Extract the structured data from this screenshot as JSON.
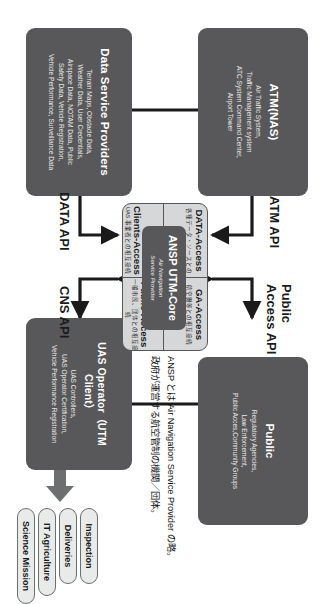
{
  "diagram": {
    "boxes": {
      "atm": {
        "title": "ATM(NAS)",
        "subtitle": "Air Traffic System,\nTraffic Management system\nATC System Command Center,\nAirport Tower"
      },
      "public": {
        "title": "Public",
        "subtitle": "Regulatory Agencies,\nLaw Enforcement,\nPublic Acces,Community Groups"
      },
      "data_service_providers": {
        "title": "Data Service Providers",
        "subtitle": "Terrain Maps, Obstacle Data,\nWeather Data, User Credentials,\nAirspace Data, NOTAM Data, Public\nSafety Data, Vehicle Registration,\nVehicle Performance, Surveillance Data"
      },
      "uas_operator": {
        "title": "UAS Operator（UTM Client）",
        "subtitle": "UAS Controllers,\nUAS Operator Certification,\nVehicle Performance Registration"
      }
    },
    "core": {
      "title": "ANSP UTM-Core",
      "subtitle": "Air Navigation\nService Provider",
      "quadrants": [
        {
          "name": "data-access",
          "title": "DATA-Access",
          "subtitle": "各種データ・ソースとの\n相互接続"
        },
        {
          "name": "ga-access",
          "title": "GA-Access",
          "subtitle": "航空機等との相互接続"
        },
        {
          "name": "utm-clients-access",
          "title": "UTM\nClients-Access",
          "subtitle": "UAS 事業者との相互接続"
        },
        {
          "name": "public-access",
          "title": "Public-Access",
          "subtitle": "一般市民、団体との相互接続"
        }
      ]
    },
    "api_labels": [
      {
        "name": "atm-api",
        "text": "ATM API"
      },
      {
        "name": "public-access-api",
        "text": "Public\nAccess API"
      },
      {
        "name": "data-api",
        "text": "DATA API"
      },
      {
        "name": "cns-api",
        "text": "CNS API"
      }
    ],
    "pills": [
      {
        "name": "inspection",
        "text": "Inspection"
      },
      {
        "name": "deliveries",
        "text": "Deliveries"
      },
      {
        "name": "it-agriculture",
        "text": "IT Agriculture"
      },
      {
        "name": "science-mission",
        "text": "Science Mission"
      }
    ],
    "note": {
      "line1": "ANSP とは Air Navigation Service Provider の略。",
      "line2": "政府が運営する航空管制の機関／団体。"
    },
    "colors": {
      "box_fill": "#58585a",
      "group_fill": "#d6d7d8",
      "pill_fill": "#e9eaea",
      "text_dark": "#1a1a1a",
      "background": "#ffffff"
    }
  }
}
